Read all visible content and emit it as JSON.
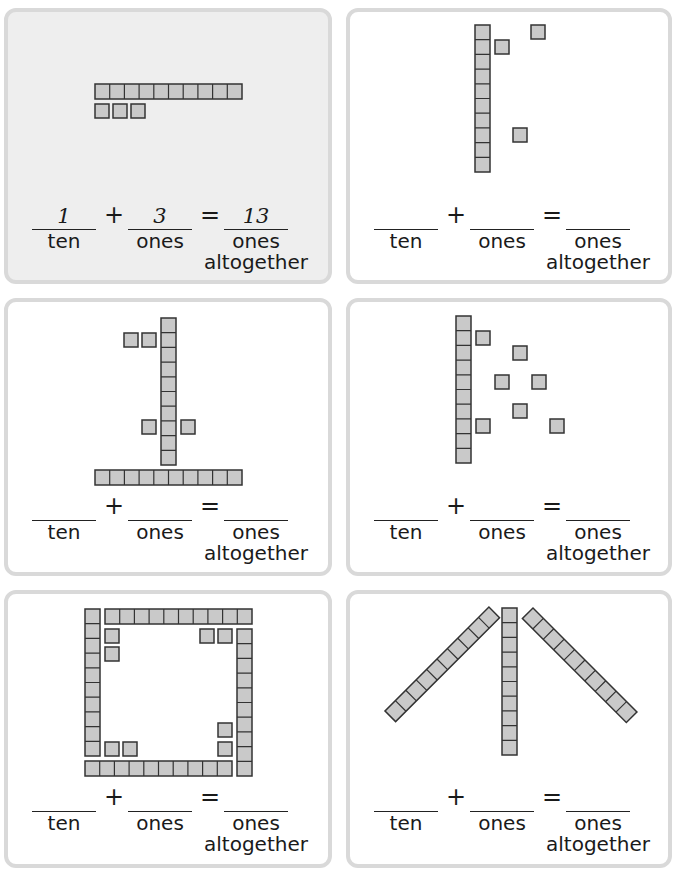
{
  "page": {
    "type": "worksheet",
    "topic": "tens and ones",
    "block_color": "#c9c9c9",
    "block_stroke": "#333333",
    "panel_border": "#d9d9d9",
    "example_bg": "#eeeeee"
  },
  "labels": {
    "ten": "ten",
    "ones": "ones",
    "altogether": "altogether",
    "plus": "+",
    "equals": "="
  },
  "panels": [
    {
      "id": "a",
      "example": true,
      "tens_rods": 1,
      "ones_cubes": 3,
      "answers": {
        "ten": "1",
        "ones": "3",
        "total": "13"
      }
    },
    {
      "id": "b",
      "example": false,
      "tens_rods": 1,
      "ones_cubes": 3,
      "answers": {
        "ten": "",
        "ones": "",
        "total": ""
      }
    },
    {
      "id": "c",
      "example": false,
      "tens_rods": 2,
      "ones_cubes": 4,
      "answers": {
        "ten": "",
        "ones": "",
        "total": ""
      }
    },
    {
      "id": "d",
      "example": false,
      "tens_rods": 1,
      "ones_cubes": 7,
      "answers": {
        "ten": "",
        "ones": "",
        "total": ""
      }
    },
    {
      "id": "e",
      "example": false,
      "tens_rods": 4,
      "ones_cubes": 8,
      "answers": {
        "ten": "",
        "ones": "",
        "total": ""
      }
    },
    {
      "id": "f",
      "example": false,
      "tens_rods": 3,
      "ones_cubes": 0,
      "answers": {
        "ten": "",
        "ones": "",
        "total": ""
      }
    }
  ]
}
